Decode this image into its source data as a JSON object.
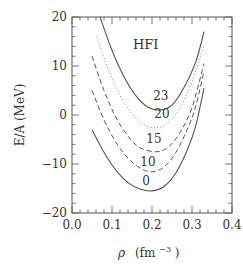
{
  "chart_data": {
    "type": "line",
    "title": "HFI",
    "xlabel": "ρ (fm⁻³)",
    "xlabel_parts": {
      "symbol": "ρ",
      "unit": "(fm",
      "exp": "−3",
      "close": ")"
    },
    "ylabel": "E/A (MeV)",
    "xlim": [
      0.0,
      0.4
    ],
    "ylim": [
      -20,
      20
    ],
    "xticks": [
      0.0,
      0.1,
      0.2,
      0.3,
      0.4
    ],
    "xtick_labels": [
      "0.0",
      "0.1",
      "0.2",
      "0.3",
      "0.4"
    ],
    "yticks": [
      -20,
      -10,
      0,
      10,
      20
    ],
    "ytick_labels": [
      "−20",
      "−10",
      "0",
      "10",
      "20"
    ],
    "grid": false,
    "legend": "inline curve labels",
    "series": [
      {
        "name": "0",
        "style": "solid",
        "label_pos": [
          0.185,
          -14.2
        ],
        "points": [
          [
            0.05,
            -3.0
          ],
          [
            0.08,
            -7.6
          ],
          [
            0.11,
            -11.3
          ],
          [
            0.14,
            -13.8
          ],
          [
            0.17,
            -15.1
          ],
          [
            0.2,
            -15.5
          ],
          [
            0.23,
            -14.6
          ],
          [
            0.26,
            -11.8
          ],
          [
            0.29,
            -6.8
          ],
          [
            0.31,
            -2.0
          ],
          [
            0.33,
            5.5
          ]
        ]
      },
      {
        "name": "10",
        "style": "dashed",
        "label_pos": [
          0.19,
          -10.4
        ],
        "points": [
          [
            0.05,
            5.0
          ],
          [
            0.08,
            -1.0
          ],
          [
            0.11,
            -5.6
          ],
          [
            0.14,
            -8.8
          ],
          [
            0.17,
            -10.8
          ],
          [
            0.2,
            -11.6
          ],
          [
            0.23,
            -10.6
          ],
          [
            0.26,
            -7.6
          ],
          [
            0.29,
            -2.6
          ],
          [
            0.31,
            2.0
          ],
          [
            0.33,
            9.0
          ]
        ]
      },
      {
        "name": "15",
        "style": "dashed",
        "label_pos": [
          0.205,
          -5.8
        ],
        "points": [
          [
            0.05,
            12.0
          ],
          [
            0.08,
            5.0
          ],
          [
            0.11,
            -0.5
          ],
          [
            0.14,
            -4.3
          ],
          [
            0.17,
            -6.7
          ],
          [
            0.21,
            -7.5
          ],
          [
            0.24,
            -6.6
          ],
          [
            0.27,
            -3.6
          ],
          [
            0.3,
            1.5
          ],
          [
            0.33,
            10.5
          ]
        ]
      },
      {
        "name": "20",
        "style": "dotted",
        "label_pos": [
          0.225,
          -0.6
        ],
        "points": [
          [
            0.062,
            16.0
          ],
          [
            0.09,
            9.5
          ],
          [
            0.12,
            4.0
          ],
          [
            0.15,
            0.2
          ],
          [
            0.18,
            -2.0
          ],
          [
            0.21,
            -2.6
          ],
          [
            0.24,
            -1.6
          ],
          [
            0.27,
            1.5
          ],
          [
            0.3,
            6.8
          ],
          [
            0.33,
            14.0
          ]
        ]
      },
      {
        "name": "23",
        "style": "solid",
        "label_pos": [
          0.222,
          3.0
        ],
        "points": [
          [
            0.07,
            20.0
          ],
          [
            0.1,
            13.2
          ],
          [
            0.13,
            7.8
          ],
          [
            0.16,
            3.9
          ],
          [
            0.19,
            1.6
          ],
          [
            0.22,
            1.0
          ],
          [
            0.25,
            2.0
          ],
          [
            0.28,
            5.6
          ],
          [
            0.31,
            11.0
          ],
          [
            0.33,
            17.0
          ]
        ]
      }
    ]
  }
}
